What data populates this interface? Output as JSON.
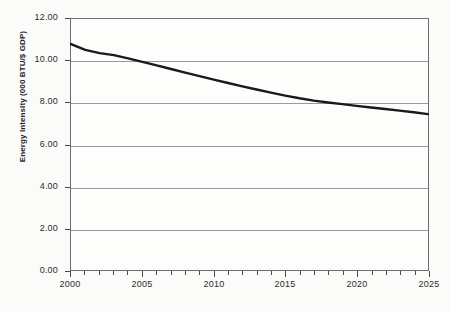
{
  "chart_data": {
    "type": "line",
    "title": "",
    "xlabel": "",
    "ylabel": "Energy Intensity (000 BTU/$ GDP)",
    "xlim": [
      2000,
      2025
    ],
    "ylim": [
      0.0,
      12.0
    ],
    "grid": true,
    "legend": "none",
    "y_ticks": [
      "0.00",
      "2.00",
      "4.00",
      "6.00",
      "8.00",
      "10.00",
      "12.00"
    ],
    "y_tick_values": [
      0,
      2,
      4,
      6,
      8,
      10,
      12
    ],
    "x_ticks": [
      "2000",
      "2005",
      "2010",
      "2015",
      "2020",
      "2025"
    ],
    "x_tick_values": [
      2000,
      2005,
      2010,
      2015,
      2020,
      2025
    ],
    "x_minor_tick_values": [
      2000,
      2001,
      2002,
      2003,
      2004,
      2005,
      2006,
      2007,
      2008,
      2009,
      2010,
      2011,
      2012,
      2013,
      2014,
      2015,
      2016,
      2017,
      2018,
      2019,
      2020,
      2021,
      2022,
      2023,
      2024,
      2025
    ],
    "x": [
      2000,
      2001,
      2002,
      2003,
      2004,
      2005,
      2006,
      2007,
      2008,
      2009,
      2010,
      2011,
      2012,
      2013,
      2014,
      2015,
      2016,
      2017,
      2018,
      2019,
      2020,
      2021,
      2022,
      2023,
      2024,
      2025
    ],
    "values": [
      10.8,
      10.52,
      10.37,
      10.27,
      10.12,
      9.95,
      9.78,
      9.61,
      9.44,
      9.27,
      9.1,
      8.94,
      8.78,
      8.63,
      8.48,
      8.34,
      8.21,
      8.1,
      8.01,
      7.93,
      7.85,
      7.77,
      7.7,
      7.62,
      7.54,
      7.45
    ],
    "series": [
      {
        "name": "Energy Intensity",
        "color": "#1a1a1a",
        "line_width": 2.4,
        "values": [
          10.8,
          10.52,
          10.37,
          10.27,
          10.12,
          9.95,
          9.78,
          9.61,
          9.44,
          9.27,
          9.1,
          8.94,
          8.78,
          8.63,
          8.48,
          8.34,
          8.21,
          8.1,
          8.01,
          7.93,
          7.85,
          7.77,
          7.7,
          7.62,
          7.54,
          7.45
        ]
      }
    ],
    "colors": {
      "background": "#fbfbfa",
      "plot_background": "#fdfdfc",
      "axis": "#6d6d6d",
      "gridline": "#9a9a9a",
      "series": "#1a1a1a",
      "text": "#2b2b2b"
    }
  }
}
